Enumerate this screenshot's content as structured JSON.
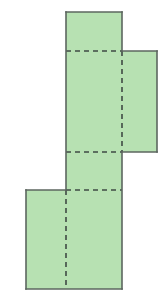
{
  "figure": {
    "title": "Net of a rectangular prism",
    "canvas": {
      "width": 165,
      "height": 300,
      "background": "#ffffff"
    },
    "style": {
      "fill": "#b7e1b2",
      "stroke": "#5c665f",
      "stroke_width": 1.6,
      "dash_stroke": "#3f4a44",
      "dash_width": 1.6,
      "dash_pattern": "5 4"
    },
    "faces": [
      {
        "name": "top-face",
        "x": 66,
        "y": 12,
        "width": 56,
        "height": 39
      },
      {
        "name": "upper-front-face",
        "x": 66,
        "y": 51,
        "width": 56,
        "height": 101
      },
      {
        "name": "right-side-flap",
        "x": 122,
        "y": 51,
        "width": 35,
        "height": 101
      },
      {
        "name": "middle-front-face",
        "x": 66,
        "y": 152,
        "width": 56,
        "height": 38
      },
      {
        "name": "lower-front-face",
        "x": 66,
        "y": 190,
        "width": 56,
        "height": 99
      },
      {
        "name": "left-side-flap",
        "x": 26,
        "y": 190,
        "width": 40,
        "height": 99
      }
    ],
    "outline_points": "66,12 122,12 122,51 157,51 157,152 122,152 122,289 26,289 26,190 66,190",
    "fold_lines": [
      {
        "name": "fold-top",
        "x1": 66,
        "y1": 51,
        "x2": 122,
        "y2": 51,
        "orientation": "horizontal"
      },
      {
        "name": "fold-middle",
        "x1": 66,
        "y1": 152,
        "x2": 122,
        "y2": 152,
        "orientation": "horizontal"
      },
      {
        "name": "fold-lower",
        "x1": 66,
        "y1": 190,
        "x2": 122,
        "y2": 190,
        "orientation": "horizontal"
      },
      {
        "name": "fold-right-vertical",
        "x1": 122,
        "y1": 51,
        "x2": 122,
        "y2": 152,
        "orientation": "vertical"
      },
      {
        "name": "fold-left-vertical",
        "x1": 66,
        "y1": 190,
        "x2": 66,
        "y2": 289,
        "orientation": "vertical"
      }
    ],
    "solid_edges": [
      {
        "name": "edge-top",
        "x1": 66,
        "y1": 12,
        "x2": 122,
        "y2": 12
      },
      {
        "name": "edge-top-left",
        "x1": 66,
        "y1": 12,
        "x2": 66,
        "y2": 190
      },
      {
        "name": "edge-top-right",
        "x1": 122,
        "y1": 12,
        "x2": 122,
        "y2": 51
      },
      {
        "name": "edge-right-flap-top",
        "x1": 122,
        "y1": 51,
        "x2": 157,
        "y2": 51
      },
      {
        "name": "edge-right-flap-right",
        "x1": 157,
        "y1": 51,
        "x2": 157,
        "y2": 152
      },
      {
        "name": "edge-right-flap-bottom",
        "x1": 122,
        "y1": 152,
        "x2": 157,
        "y2": 152
      },
      {
        "name": "edge-lower-right",
        "x1": 122,
        "y1": 152,
        "x2": 122,
        "y2": 289
      },
      {
        "name": "edge-bottom",
        "x1": 26,
        "y1": 289,
        "x2": 122,
        "y2": 289
      },
      {
        "name": "edge-left-flap-left",
        "x1": 26,
        "y1": 190,
        "x2": 26,
        "y2": 289
      },
      {
        "name": "edge-left-flap-top",
        "x1": 26,
        "y1": 190,
        "x2": 66,
        "y2": 190
      }
    ]
  }
}
